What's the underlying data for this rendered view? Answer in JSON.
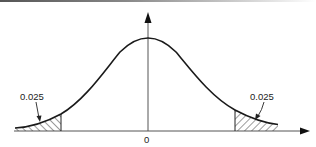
{
  "figure": {
    "type": "normal-distribution-two-tailed",
    "tail_left_label": "0.025",
    "tail_right_label": "0.025",
    "center_tick_label": "0",
    "colors": {
      "line": "#1a1a1a",
      "axis": "#555555",
      "hatch": "#222222"
    }
  }
}
